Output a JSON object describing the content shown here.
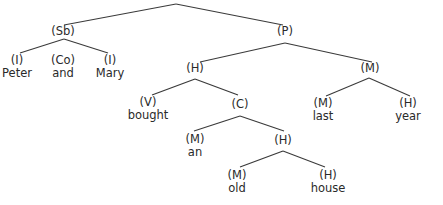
{
  "diagram": {
    "type": "syntax-tree",
    "colors": {
      "line": "#3a3a3a",
      "text": "#2a2a2a",
      "background": "#ffffff"
    },
    "nodes": {
      "sb": {
        "tag": "(Sb)"
      },
      "p": {
        "tag": "(P)"
      },
      "peter": {
        "tag": "(I)",
        "word": "Peter"
      },
      "and": {
        "tag": "(Co)",
        "word": "and"
      },
      "mary": {
        "tag": "(I)",
        "word": "Mary"
      },
      "h1": {
        "tag": "(H)"
      },
      "m1": {
        "tag": "(M)"
      },
      "bought": {
        "tag": "(V)",
        "word": "bought"
      },
      "c": {
        "tag": "(C)"
      },
      "last": {
        "tag": "(M)",
        "word": "last"
      },
      "year": {
        "tag": "(H)",
        "word": "year"
      },
      "an": {
        "tag": "(M)",
        "word": "an"
      },
      "h2": {
        "tag": "(H)"
      },
      "old": {
        "tag": "(M)",
        "word": "old"
      },
      "house": {
        "tag": "(H)",
        "word": "house"
      }
    },
    "edges": [
      [
        "root",
        "sb"
      ],
      [
        "root",
        "p"
      ],
      [
        "sb",
        "peter"
      ],
      [
        "sb",
        "mary"
      ],
      [
        "p",
        "h1"
      ],
      [
        "p",
        "m1"
      ],
      [
        "h1",
        "bought"
      ],
      [
        "h1",
        "c"
      ],
      [
        "m1",
        "last"
      ],
      [
        "m1",
        "year"
      ],
      [
        "c",
        "an"
      ],
      [
        "c",
        "h2"
      ],
      [
        "h2",
        "old"
      ],
      [
        "h2",
        "house"
      ]
    ]
  }
}
